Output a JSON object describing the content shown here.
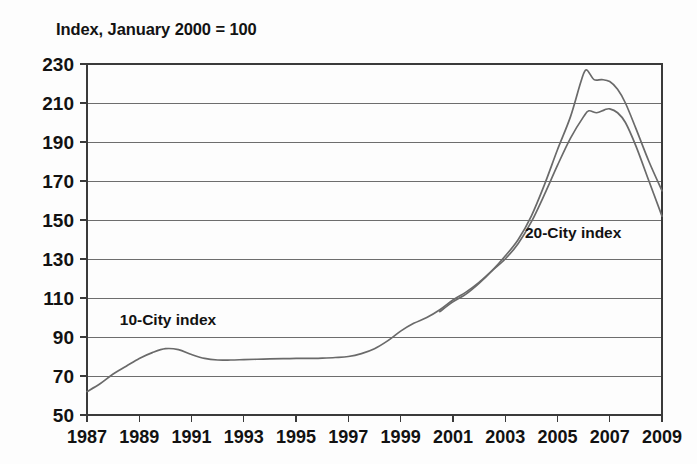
{
  "chart_data": {
    "type": "line",
    "title": "Index, January 2000 = 100",
    "xlabel": "",
    "ylabel": "",
    "xlim": [
      1987,
      2009
    ],
    "ylim": [
      50,
      230
    ],
    "ytick_step": 20,
    "xtick_step": 2,
    "grid": true,
    "legend_position": "inline-annotations",
    "yticks": [
      230,
      210,
      190,
      170,
      150,
      130,
      110,
      90,
      70,
      50
    ],
    "xticks": [
      1987,
      1989,
      1991,
      1993,
      1995,
      1997,
      1999,
      2001,
      2003,
      2005,
      2007,
      2009
    ],
    "annotations": [
      {
        "text": "10-City index",
        "x": 1990.1,
        "y": 96
      },
      {
        "text": "20-City index",
        "x": 2005.6,
        "y": 141
      }
    ],
    "series": [
      {
        "name": "10-City index",
        "color": "#6a6a6a",
        "x": [
          1987.0,
          1987.5,
          1988.0,
          1988.5,
          1989.0,
          1989.5,
          1990.0,
          1990.5,
          1991.0,
          1991.5,
          1992.0,
          1992.5,
          1993.0,
          1993.5,
          1994.0,
          1994.5,
          1995.0,
          1995.5,
          1996.0,
          1996.5,
          1997.0,
          1997.5,
          1998.0,
          1998.5,
          1999.0,
          1999.5,
          2000.0,
          2000.5,
          2001.0,
          2001.5,
          2002.0,
          2002.5,
          2003.0,
          2003.5,
          2004.0,
          2004.5,
          2005.0,
          2005.5,
          2006.0,
          2006.2,
          2006.5,
          2006.8,
          2007.0,
          2007.3,
          2007.6,
          2008.0,
          2008.5,
          2009.0
        ],
        "values": [
          62,
          66,
          71,
          75,
          79,
          82,
          84,
          83.5,
          81,
          79,
          78.2,
          78.2,
          78.4,
          78.6,
          78.8,
          78.9,
          79,
          79,
          79.2,
          79.5,
          80,
          81.5,
          84,
          88,
          93,
          97,
          100,
          104,
          109,
          113,
          118,
          124,
          130,
          138,
          149,
          163,
          178,
          192,
          203,
          206,
          205,
          206.5,
          207,
          205,
          200,
          188,
          170,
          152
        ]
      },
      {
        "name": "20-City index",
        "color": "#6a6a6a",
        "x": [
          2000.5,
          2001.0,
          2001.5,
          2002.0,
          2002.5,
          2003.0,
          2003.5,
          2004.0,
          2004.5,
          2005.0,
          2005.5,
          2005.9,
          2006.1,
          2006.4,
          2006.7,
          2007.0,
          2007.3,
          2007.6,
          2008.0,
          2008.5,
          2009.0
        ],
        "values": [
          103,
          108,
          112,
          117.5,
          124,
          131.5,
          140,
          152,
          168,
          186,
          203,
          221,
          227,
          222,
          222,
          221,
          217,
          210,
          197,
          180,
          165
        ]
      }
    ]
  }
}
